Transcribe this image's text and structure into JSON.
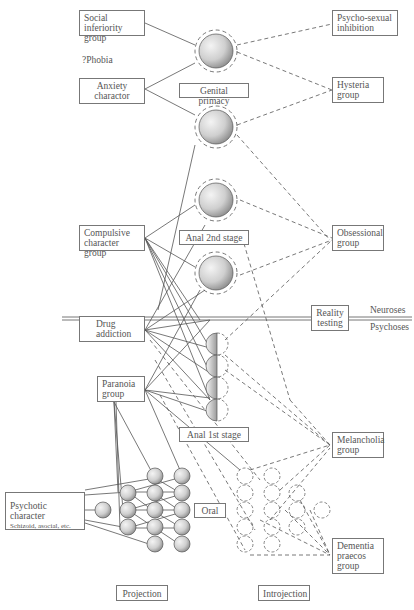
{
  "left_column": {
    "social_inferiority": "Social inferiority group",
    "phobia": "?Phobia",
    "anxiety_character": "Anxiety charactor",
    "compulsive": "Compulsive character group",
    "drug_addiction": "Drug addiction",
    "paranoia": "Paranoia group",
    "psychotic_character": "Psychotic character",
    "psychotic_subtitle": "Schizoid, asocial, etc."
  },
  "middle_labels": {
    "genital_primacy": "Genital primacy",
    "anal_2nd": "Anal 2nd stage",
    "anal_1st": "Anal 1st stage",
    "oral": "Oral",
    "reality_testing": "Reality testing"
  },
  "right_column": {
    "psycho_sexual": "Psycho-sexual inhibition",
    "hysteria": "Hysteria group",
    "obsessional": "Obsessional group",
    "melancholia": "Melancholia group",
    "dementia": "Dementia praecos group"
  },
  "divider": {
    "above": "Neuroses",
    "below": "Psychoses"
  },
  "bottom": {
    "projection": "Projection",
    "introjection": "Introjection"
  },
  "colors": {
    "line": "#555555",
    "sphere_light": "#f2f2f2",
    "sphere_dark": "#9a9a9a"
  }
}
